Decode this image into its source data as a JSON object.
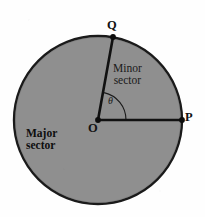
{
  "figure": {
    "type": "circle-sector-diagram",
    "background_color": "#fefefe",
    "width": 205,
    "height": 217
  },
  "circle": {
    "center": {
      "x": 98,
      "y": 120,
      "label": "O"
    },
    "radius": 84,
    "fill_color": "#8f8f8f",
    "stroke_color": "#1a1a1a",
    "stroke_width": 2.4
  },
  "points": [
    {
      "id": "Q",
      "label": "Q",
      "x": 113,
      "y": 37
    },
    {
      "id": "P",
      "label": "P",
      "x": 182,
      "y": 120
    },
    {
      "id": "O",
      "label": "O",
      "x": 98,
      "y": 120
    }
  ],
  "radii": [
    {
      "from": "O",
      "to": "P",
      "stroke_color": "#111111",
      "stroke_width": 2.6
    },
    {
      "from": "O",
      "to": "Q",
      "stroke_color": "#111111",
      "stroke_width": 2.6
    }
  ],
  "angle": {
    "symbol": "θ",
    "vertex": "O",
    "between": [
      "OP",
      "OQ"
    ],
    "arc_radius": 28,
    "arc_stroke_color": "#1a1a1a"
  },
  "labels": {
    "minor_sector": {
      "line1": "Minor",
      "line2": "sector"
    },
    "major_sector": {
      "line1": "Major",
      "line2": "sector"
    }
  }
}
